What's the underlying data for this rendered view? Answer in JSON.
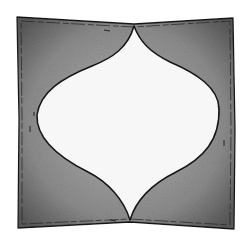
{
  "illustration": {
    "subject": "square pillow sketch with ogee-shaped center panel",
    "colors": {
      "background": "#ffffff",
      "pillow_fill": "#8a8a8a",
      "pillow_shade": "#5e5e5e",
      "panel_fill": "#f6f6f6",
      "outline": "#1a1a1a"
    }
  }
}
